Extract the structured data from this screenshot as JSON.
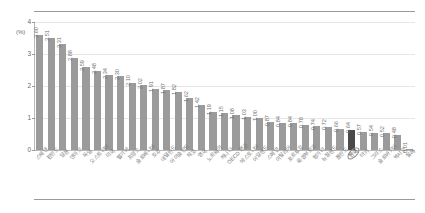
{
  "chart_data": {
    "type": "bar",
    "title": "",
    "xlabel": "",
    "ylabel": "",
    "yunit": "(%)",
    "ylim": [
      0,
      4
    ],
    "yticks": [
      "0",
      "1",
      "2",
      "3",
      "4"
    ],
    "grid": true,
    "legend": "none",
    "highlight_label": "한국",
    "highlight_color": "#4a4a4a",
    "bar_color": "#9b9b9b",
    "categories": [
      "스웨덴",
      "핀란드",
      "일본",
      "덴마크",
      "독일",
      "오스트리아",
      "미국",
      "벨기에",
      "프랑스",
      "슬로베니아",
      "호주",
      "네덜란드",
      "아이슬란드",
      "체코",
      "영국",
      "노르웨이",
      "캐나다",
      "OECD 평균",
      "에스토니아",
      "아일랜드",
      "스페인",
      "이탈리아",
      "포르투갈",
      "룩셈부르크",
      "헝가리",
      "뉴질랜드",
      "폴란드",
      "한국",
      "터키",
      "그리스",
      "슬로바키아",
      "멕시코",
      "칠레"
    ],
    "values": [
      3.6,
      3.51,
      3.31,
      2.88,
      2.59,
      2.48,
      2.34,
      2.3,
      2.1,
      2.02,
      1.91,
      1.87,
      1.82,
      1.62,
      1.42,
      1.19,
      1.15,
      1.08,
      1.03,
      1.0,
      0.87,
      0.84,
      0.84,
      0.78,
      0.74,
      0.72,
      0.66,
      0.64,
      0.57,
      0.54,
      0.52,
      0.48,
      0.01
    ],
    "value_labels": [
      "3.60",
      "3.51",
      "3.31",
      "2.88",
      "2.59",
      "2.48",
      "2.34",
      "2.30",
      "2.10",
      "2.02",
      "1.91",
      "1.87",
      "1.82",
      "1.62",
      "1.42",
      "1.19",
      "1.15",
      "1.08",
      "1.03",
      "1.00",
      "0.87",
      "0.84",
      "0.84",
      "0.78",
      "0.74",
      "0.72",
      "0.66",
      "0.64",
      "0.57",
      "0.54",
      "0.52",
      "0.48",
      "0.01"
    ]
  }
}
